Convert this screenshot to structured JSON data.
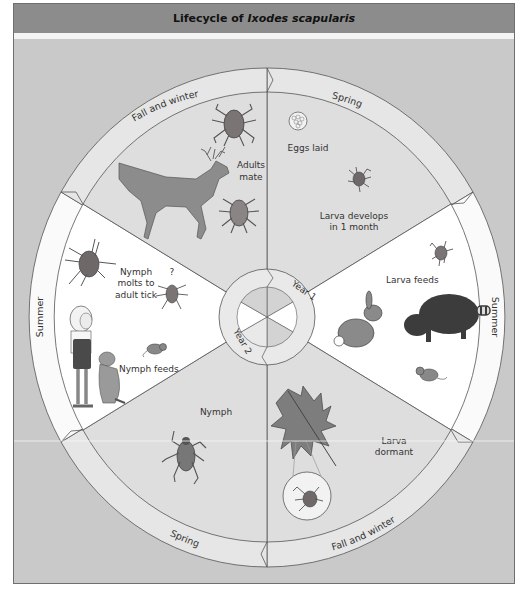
{
  "title": {
    "prefix": "Lifecycle of",
    "species": "Ixodes scapularis"
  },
  "colors": {
    "header_bg": "#8c8c8c",
    "background": "#c9c9c9",
    "sector_gray": "#dcdcdc",
    "sector_white": "#ffffff",
    "band_gray": "#e8e8e8",
    "band_white": "#fbfbfb",
    "tick_body": "#7a6a6a",
    "outline": "#555555"
  },
  "center": {
    "year1": "Year 1",
    "year2": "Year 2"
  },
  "sectors": [
    {
      "id": "top-right",
      "season": "Spring",
      "labels": [
        "Eggs laid",
        "Larva develops",
        "in 1 month"
      ]
    },
    {
      "id": "right",
      "season": "Summer",
      "labels": [
        "Larva feeds"
      ]
    },
    {
      "id": "bottom-right",
      "season": "Fall and winter",
      "labels": [
        "Larva",
        "dormant"
      ]
    },
    {
      "id": "bottom-left",
      "season": "Spring",
      "labels": [
        "Nymph"
      ]
    },
    {
      "id": "left",
      "season": "Summer",
      "labels": [
        "Nymph",
        "molts to",
        "adult tick",
        "Nymph feeds",
        "?"
      ]
    },
    {
      "id": "top-left",
      "season": "Fall and winter",
      "labels": [
        "Adults",
        "mate"
      ]
    }
  ]
}
